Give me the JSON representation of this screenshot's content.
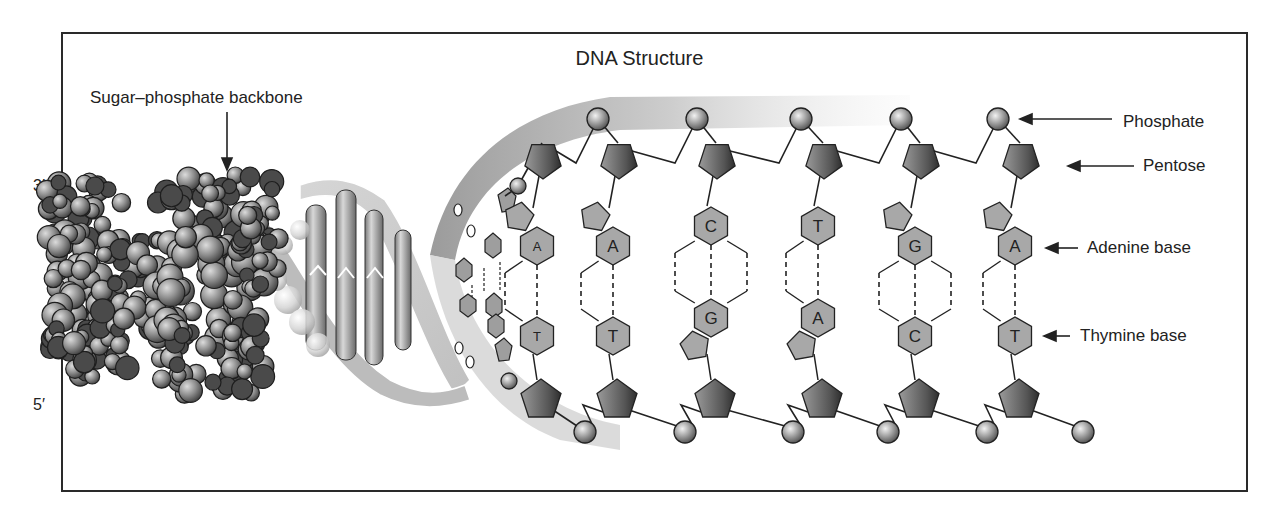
{
  "title": "DNA Structure",
  "ends": {
    "top_left": "3′",
    "bottom_left": "5′"
  },
  "callouts": {
    "backbone": "Sugar–phosphate backbone",
    "phosphate": "Phosphate",
    "pentose": "Pentose",
    "adenine": "Adenine base",
    "thymine": "Thymine base"
  },
  "base_pairs": [
    {
      "top": "A",
      "bottom": "T",
      "hbonds": 2
    },
    {
      "top": "A",
      "bottom": "T",
      "hbonds": 2
    },
    {
      "top": "C",
      "bottom": "G",
      "hbonds": 3
    },
    {
      "top": "T",
      "bottom": "A",
      "hbonds": 2
    },
    {
      "top": "G",
      "bottom": "C",
      "hbonds": 3
    },
    {
      "top": "A",
      "bottom": "T",
      "hbonds": 2
    }
  ],
  "colors": {
    "frame": "#2a2a2a",
    "base_fill": "#a8a8a8",
    "sugar_dark": "#4a4a4a",
    "sugar_light": "#9a9a9a",
    "phosphate": "#b5b5b5",
    "ribbon": "#c9c9c9",
    "ribbon_dark": "#8c8c8c"
  }
}
